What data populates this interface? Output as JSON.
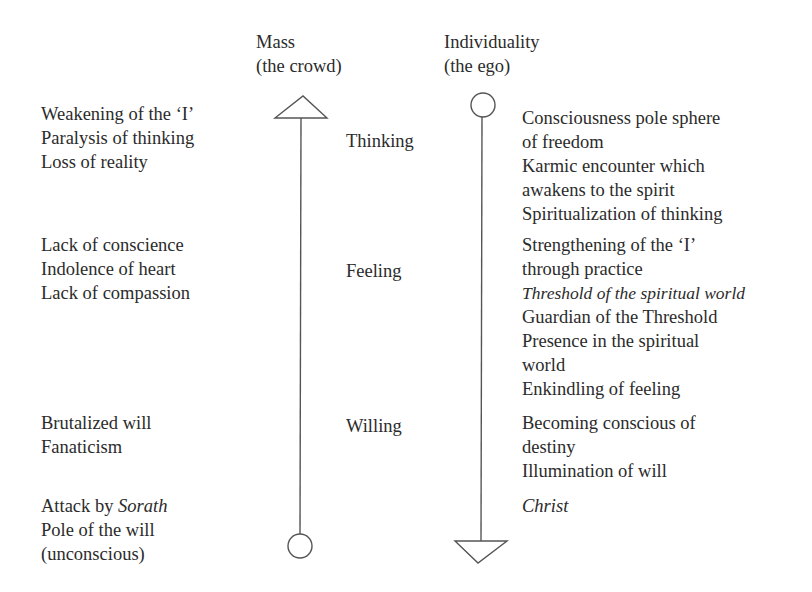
{
  "headers": {
    "mass": {
      "line1": "Mass",
      "line2": "(the crowd)"
    },
    "individuality": {
      "line1": "Individuality",
      "line2": "(the ego)"
    }
  },
  "center_labels": {
    "thinking": "Thinking",
    "feeling": "Feeling",
    "willing": "Willing"
  },
  "left": {
    "thinking": [
      "Weakening of the ‘I’",
      "Paralysis of thinking",
      "Loss of reality"
    ],
    "feeling": [
      "Lack of conscience",
      "Indolence of heart",
      "Lack of compassion"
    ],
    "willing": [
      "Brutalized will",
      "Fanaticism"
    ],
    "pole": {
      "prefix": "Attack by ",
      "italic": "Sorath",
      "line2": "Pole of the will",
      "line3": "(unconscious)"
    }
  },
  "right": {
    "thinking": [
      "Consciousness pole sphere",
      "of freedom",
      "Karmic encounter which",
      "awakens to the spirit",
      "Spiritualization of thinking"
    ],
    "feeling": {
      "line1": "Strengthening of the ‘I’",
      "line2": "through practice",
      "italic": "Threshold of the spiritual world",
      "line4": "Guardian of the Threshold",
      "line5": "Presence in the spiritual",
      "line6": "world",
      "line7": "Enkindling of feeling"
    },
    "willing": [
      "Becoming conscious of",
      "destiny",
      "Illumination of will"
    ],
    "pole": "Christ"
  },
  "colors": {
    "text": "#2b2b2b",
    "line": "#555555"
  }
}
